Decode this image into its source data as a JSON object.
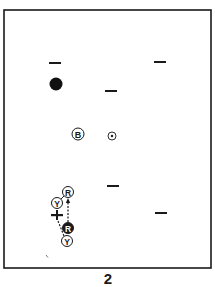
{
  "diagram": {
    "type": "table-position-diagram",
    "figure_number": "2",
    "frame": {
      "x": 4,
      "y": 10,
      "width": 207,
      "height": 258,
      "stroke": "#1a1a1a"
    },
    "markers": [
      {
        "id": "dash-1",
        "kind": "dash",
        "x": 55,
        "y": 63
      },
      {
        "id": "dash-2",
        "kind": "dash",
        "x": 160,
        "y": 62
      },
      {
        "id": "dash-3",
        "kind": "dash",
        "x": 111,
        "y": 91
      },
      {
        "id": "dash-4",
        "kind": "dash",
        "x": 113,
        "y": 186
      },
      {
        "id": "dash-5",
        "kind": "dash",
        "x": 161,
        "y": 213
      }
    ],
    "balls": [
      {
        "id": "black-ball",
        "label": "",
        "style": "solid",
        "x": 56,
        "y": 84,
        "r": 6.5
      },
      {
        "id": "ball-b",
        "label": "B",
        "style": "ring",
        "x": 78,
        "y": 134,
        "r": 6
      },
      {
        "id": "spot-ball",
        "label": "",
        "style": "dot",
        "x": 112,
        "y": 136,
        "r": 4
      },
      {
        "id": "ball-r-top",
        "label": "R",
        "style": "ring",
        "x": 68,
        "y": 192,
        "r": 5.5
      },
      {
        "id": "ball-y-top",
        "label": "Y",
        "style": "ring",
        "x": 57,
        "y": 203,
        "r": 5.5
      },
      {
        "id": "ball-r-dark",
        "label": "R",
        "style": "dark",
        "x": 68,
        "y": 228,
        "r": 5.5
      },
      {
        "id": "ball-y-bottom",
        "label": "Y",
        "style": "ring",
        "x": 67,
        "y": 241,
        "r": 5.5
      }
    ],
    "cross": {
      "x": 57,
      "y": 215
    },
    "paths": [
      {
        "id": "path-r-up",
        "from": [
          68,
          222
        ],
        "to": [
          68,
          199
        ],
        "dashed": true,
        "arrow": true
      },
      {
        "id": "path-y-r",
        "from": [
          61,
          199
        ],
        "to": [
          64,
          196
        ],
        "dashed": false,
        "arrow": false
      },
      {
        "id": "path-cross-y",
        "from": [
          58,
          221
        ],
        "to": [
          64,
          236
        ],
        "dashed": true,
        "arrow": false
      }
    ],
    "stray_mark": {
      "x": 47,
      "y": 256
    }
  },
  "colors": {
    "ink": "#1a1a1a",
    "paper": "#ffffff"
  }
}
